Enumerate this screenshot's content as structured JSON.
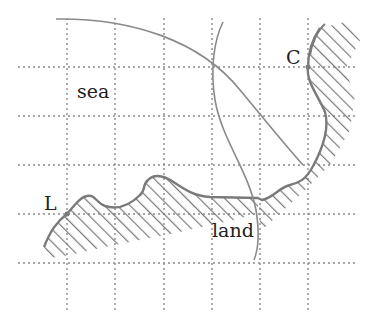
{
  "diagram": {
    "labels": {
      "sea": "sea",
      "land": "land",
      "point_l": "L",
      "point_c": "C"
    },
    "grid": {
      "x_lines": [
        67,
        115,
        164,
        212,
        260,
        308
      ],
      "y_lines": [
        67,
        116,
        165,
        214,
        263
      ],
      "x_range": [
        18,
        358
      ],
      "y_range": [
        18,
        310
      ],
      "style": "dotted"
    },
    "points": {
      "L": [
        67,
        214
      ],
      "C": [
        308,
        67
      ]
    },
    "colors": {
      "grid": "#888888",
      "line": "#7a7a7a",
      "text": "#222222"
    }
  }
}
